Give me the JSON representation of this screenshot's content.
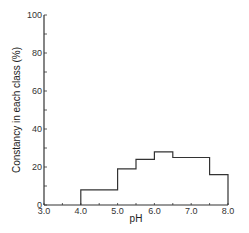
{
  "chart_data": {
    "type": "bar",
    "subtype": "step-histogram",
    "title": "",
    "xlabel": "pH",
    "ylabel": "Constancy in each class (%)",
    "xlim": [
      3.0,
      8.0
    ],
    "ylim": [
      0,
      100
    ],
    "grid": false,
    "legend": null,
    "x_ticks": [
      "3.0",
      "4.0",
      "5.0",
      "6.0",
      "7.0",
      "8.0"
    ],
    "y_ticks": [
      "0",
      "20",
      "40",
      "60",
      "80",
      "100"
    ],
    "bins": [
      {
        "from": 4.0,
        "to": 5.0,
        "value": 8
      },
      {
        "from": 5.0,
        "to": 5.5,
        "value": 19
      },
      {
        "from": 5.5,
        "to": 6.0,
        "value": 24
      },
      {
        "from": 6.0,
        "to": 6.5,
        "value": 28
      },
      {
        "from": 6.5,
        "to": 7.5,
        "value": 25
      },
      {
        "from": 7.5,
        "to": 8.0,
        "value": 16
      }
    ],
    "categories": [
      "4.0-5.0",
      "5.0-5.5",
      "5.5-6.0",
      "6.0-6.5",
      "6.5-7.5",
      "7.5-8.0"
    ],
    "values": [
      8,
      19,
      24,
      28,
      25,
      16
    ]
  },
  "colors": {
    "line": "#333333",
    "background": "#ffffff"
  }
}
